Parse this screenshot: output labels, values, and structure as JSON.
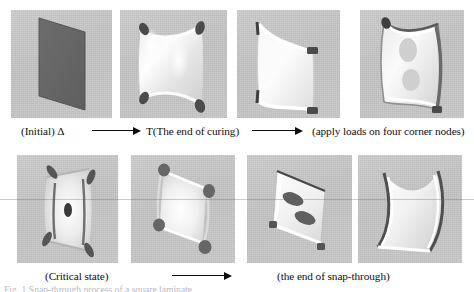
{
  "figure": {
    "rows": [
      {
        "id": "row-1",
        "panels": [
          {
            "id": "panel-initial",
            "alt": "flat undeformed square plate rendered as dark gray parallelogram"
          },
          {
            "id": "panel-end-of-curing",
            "alt": "saddle shaped cured shell with dark corner node markers"
          },
          {
            "id": "panel-loads-applied",
            "alt": "curved shell with two corner loads applied"
          },
          {
            "id": "panel-loaded-shell",
            "alt": "strongly deformed shell with two dark interior contour blobs"
          }
        ],
        "captions": [
          {
            "id": "caption-initial",
            "text": "(Initial) Δ"
          },
          {
            "id": "caption-curing",
            "text": "T(The end of curing)"
          },
          {
            "id": "caption-loads",
            "text": "(apply loads on four corner nodes)"
          }
        ],
        "arrows": [
          {
            "id": "arrow-initial-to-curing"
          },
          {
            "id": "arrow-curing-to-loads"
          }
        ]
      },
      {
        "id": "row-2",
        "panels": [
          {
            "id": "panel-critical-state",
            "alt": "shell at critical state with central dark spot"
          },
          {
            "id": "panel-post-critical",
            "alt": "snapping shell with four dark corner nodes"
          },
          {
            "id": "panel-snap-through",
            "alt": "snapped-through shell with two elongated dark blobs"
          },
          {
            "id": "panel-final-configuration",
            "alt": "final single-curvature snapped shell seen edge on"
          }
        ],
        "captions": [
          {
            "id": "caption-critical",
            "text": "(Critical state)"
          },
          {
            "id": "caption-snap-through",
            "text": "(the end of snap-through)"
          }
        ],
        "arrows": [
          {
            "id": "arrow-critical-to-snap"
          }
        ]
      }
    ],
    "bottom_caption": {
      "id": "figure-caption",
      "text": "Fig. 1  Snap-through process of a square laminate"
    }
  }
}
